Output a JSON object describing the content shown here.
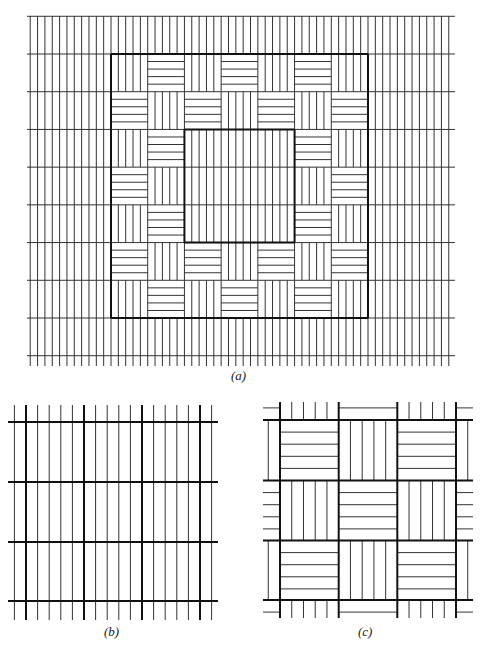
{
  "figure": {
    "panels": [
      {
        "id": "a",
        "caption": "(a)",
        "description": "Field of vertical line texture with a 7x7 checkerboard of vertical/horizontal hatched blocks; central 3x3 region filled with plain vertical texture",
        "block_grid": {
          "rows": 7,
          "cols": 7,
          "pattern": "checkerboard",
          "even_cell": "vertical",
          "odd_cell": "horizontal",
          "lines_per_block": 4,
          "center_region": {
            "rows": 3,
            "cols": 3,
            "fill": "vertical"
          }
        }
      },
      {
        "id": "b",
        "caption": "(b)",
        "description": "Uniform vertical line texture with thick grid lines",
        "grid": {
          "thick_rows": 4,
          "thick_cols": 4,
          "thin_lines_per_cell": 4
        }
      },
      {
        "id": "c",
        "caption": "(c)",
        "description": "3x3 checkerboard of horizontal/vertical hatched blocks with thick borders and partial edge blocks",
        "block_grid": {
          "rows": 3,
          "cols": 3,
          "pattern": "checkerboard",
          "even_cell": "horizontal",
          "odd_cell": "vertical",
          "lines_per_block": 4
        }
      }
    ]
  }
}
